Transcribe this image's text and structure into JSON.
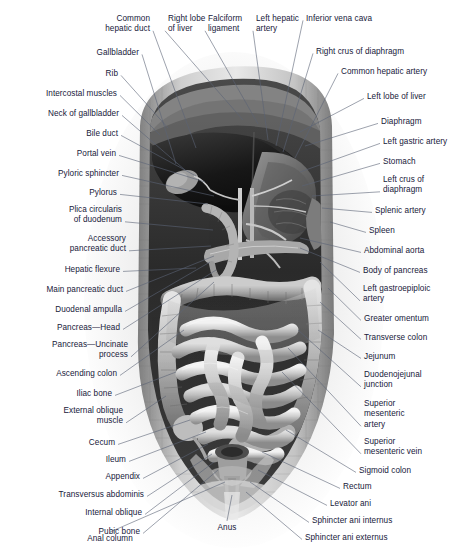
{
  "figure": {
    "background_color": "#ffffff",
    "label_color": "#17203a",
    "leader_color": "#5a6375"
  },
  "labels_left": [
    {
      "id": "common-hepatic-duct",
      "text": "Common\nhepatic duct",
      "x": 150,
      "y": 14,
      "anchor": [
        196,
        148
      ]
    },
    {
      "id": "gallbladder",
      "text": "Gallbladder",
      "x": 139,
      "y": 48,
      "anchor": [
        176,
        164
      ]
    },
    {
      "id": "rib",
      "text": "Rib",
      "x": 118,
      "y": 69,
      "anchor": [
        168,
        128
      ]
    },
    {
      "id": "intercostal-muscles",
      "text": "Intercostal muscles",
      "x": 117,
      "y": 89,
      "anchor": [
        160,
        135
      ]
    },
    {
      "id": "neck-of-gallbladder",
      "text": "Neck of gallbladder",
      "x": 119,
      "y": 109,
      "anchor": [
        185,
        170
      ]
    },
    {
      "id": "bile-duct",
      "text": "Bile duct",
      "x": 118,
      "y": 129,
      "anchor": [
        196,
        176
      ]
    },
    {
      "id": "portal-vein",
      "text": "Portal vein",
      "x": 116,
      "y": 149,
      "anchor": [
        205,
        182
      ]
    },
    {
      "id": "pyloric-sphincter",
      "text": "Pyloric sphincter",
      "x": 119,
      "y": 169,
      "anchor": [
        214,
        196
      ]
    },
    {
      "id": "pylorus",
      "text": "Pylorus",
      "x": 117,
      "y": 188,
      "anchor": [
        208,
        204
      ]
    },
    {
      "id": "plica-circularis",
      "text": "Plica circularis\nof duodenum",
      "x": 122,
      "y": 205,
      "anchor": [
        213,
        230
      ]
    },
    {
      "id": "accessory-pancreatic-duct",
      "text": "Accessory\npancreatic duct",
      "x": 126,
      "y": 234,
      "anchor": [
        211,
        246
      ]
    },
    {
      "id": "hepatic-flexure",
      "text": "Hepatic flexure",
      "x": 120,
      "y": 265,
      "anchor": [
        196,
        268
      ]
    },
    {
      "id": "main-pancreatic-duct",
      "text": "Main pancreatic duct",
      "x": 123,
      "y": 285,
      "anchor": [
        214,
        256
      ]
    },
    {
      "id": "duodenal-ampulla",
      "text": "Duodenal ampulla",
      "x": 122,
      "y": 305,
      "anchor": [
        210,
        262
      ]
    },
    {
      "id": "pancreas-head",
      "text": "Pancreas—Head",
      "x": 120,
      "y": 323,
      "anchor": [
        216,
        270
      ]
    },
    {
      "id": "pancreas-uncinate",
      "text": "Pancreas—Uncinate\nprocess",
      "x": 128,
      "y": 340,
      "anchor": [
        214,
        282
      ]
    },
    {
      "id": "ascending-colon",
      "text": "Ascending colon",
      "x": 117,
      "y": 369,
      "anchor": [
        184,
        330
      ]
    },
    {
      "id": "iliac-bone",
      "text": "Iliac bone",
      "x": 112,
      "y": 389,
      "anchor": [
        176,
        372
      ]
    },
    {
      "id": "external-oblique-muscle",
      "text": "External oblique\nmuscle",
      "x": 123,
      "y": 406,
      "anchor": [
        166,
        396
      ]
    },
    {
      "id": "cecum",
      "text": "Cecum",
      "x": 115,
      "y": 438,
      "anchor": [
        190,
        420
      ]
    },
    {
      "id": "ileum",
      "text": "Ileum",
      "x": 126,
      "y": 455,
      "anchor": [
        206,
        432
      ]
    },
    {
      "id": "appendix",
      "text": "Appendix",
      "x": 140,
      "y": 472,
      "anchor": [
        208,
        444
      ]
    },
    {
      "id": "transversus-abdominis",
      "text": "Transversus abdominis",
      "x": 144,
      "y": 490,
      "anchor": [
        212,
        454
      ]
    },
    {
      "id": "internal-oblique",
      "text": "Internal oblique",
      "x": 142,
      "y": 508,
      "anchor": [
        214,
        462
      ]
    },
    {
      "id": "pubic-bone",
      "text": "Pubic bone",
      "x": 140,
      "y": 527,
      "anchor": [
        218,
        470
      ]
    }
  ],
  "labels_right": [
    {
      "id": "right-lobe-of-liver",
      "text": "Right lobe\nof liver",
      "x": 168,
      "y": 14,
      "anchor": [
        243,
        120
      ]
    },
    {
      "id": "falciform-ligament",
      "text": "Falciform\nligament",
      "x": 208,
      "y": 14,
      "anchor": [
        258,
        124
      ]
    },
    {
      "id": "left-hepatic-artery",
      "text": "Left hepatic\nartery",
      "x": 256,
      "y": 14,
      "anchor": [
        268,
        140
      ]
    },
    {
      "id": "inferior-vena-cava",
      "text": "Inferior vena cava",
      "x": 306,
      "y": 14,
      "anchor": [
        276,
        146
      ]
    },
    {
      "id": "right-crus-of-diaphragm",
      "text": "Right crus of diaphragm",
      "x": 316,
      "y": 47,
      "anchor": [
        283,
        152
      ]
    },
    {
      "id": "common-hepatic-artery",
      "text": "Common hepatic artery",
      "x": 341,
      "y": 67,
      "anchor": [
        295,
        158
      ]
    },
    {
      "id": "left-lobe-of-liver",
      "text": "Left lobe of liver",
      "x": 367,
      "y": 92,
      "anchor": [
        300,
        132
      ]
    },
    {
      "id": "diaphragm",
      "text": "Diaphragm",
      "x": 381,
      "y": 117,
      "anchor": [
        305,
        146
      ]
    },
    {
      "id": "left-gastric-artery",
      "text": "Left gastric artery",
      "x": 383,
      "y": 137,
      "anchor": [
        300,
        172
      ]
    },
    {
      "id": "stomach",
      "text": "Stomach",
      "x": 383,
      "y": 157,
      "anchor": [
        302,
        186
      ]
    },
    {
      "id": "left-crus-of-diaphragm",
      "text": "Left crus of\ndiaphragm",
      "x": 383,
      "y": 175,
      "anchor": [
        312,
        196
      ]
    },
    {
      "id": "splenic-artery",
      "text": "Splenic artery",
      "x": 375,
      "y": 206,
      "anchor": [
        322,
        208
      ]
    },
    {
      "id": "spleen",
      "text": "Spleen",
      "x": 369,
      "y": 226,
      "anchor": [
        330,
        222
      ]
    },
    {
      "id": "abdominal-aorta",
      "text": "Abdominal aorta",
      "x": 364,
      "y": 246,
      "anchor": [
        300,
        238
      ]
    },
    {
      "id": "body-of-pancreas",
      "text": "Body of pancreas",
      "x": 363,
      "y": 266,
      "anchor": [
        300,
        248
      ]
    },
    {
      "id": "left-gastroepiploic-artery",
      "text": "Left gastroepiploic\nartery",
      "x": 363,
      "y": 284,
      "anchor": [
        320,
        262
      ]
    },
    {
      "id": "greater-omentum",
      "text": "Greater omentum",
      "x": 364,
      "y": 314,
      "anchor": [
        328,
        288
      ]
    },
    {
      "id": "transverse-colon",
      "text": "Transverse colon",
      "x": 364,
      "y": 333,
      "anchor": [
        320,
        302
      ]
    },
    {
      "id": "jejunum",
      "text": "Jejunum",
      "x": 364,
      "y": 352,
      "anchor": [
        318,
        330
      ]
    },
    {
      "id": "duodenojejunal-junction",
      "text": "Duodenojejunal\njunction",
      "x": 364,
      "y": 370,
      "anchor": [
        298,
        330
      ]
    },
    {
      "id": "superior-mesenteric-artery",
      "text": "Superior\nmesenteric\nartery",
      "x": 364,
      "y": 399,
      "anchor": [
        288,
        348
      ]
    },
    {
      "id": "superior-mesenteric-vein",
      "text": "Superior\nmesenteric vein",
      "x": 364,
      "y": 437,
      "anchor": [
        282,
        372
      ]
    },
    {
      "id": "sigmoid-colon",
      "text": "Sigmoid colon",
      "x": 359,
      "y": 466,
      "anchor": [
        286,
        430
      ]
    },
    {
      "id": "rectum",
      "text": "Rectum",
      "x": 343,
      "y": 482,
      "anchor": [
        262,
        452
      ]
    },
    {
      "id": "levator-ani",
      "text": "Levator ani",
      "x": 330,
      "y": 499,
      "anchor": [
        258,
        470
      ]
    },
    {
      "id": "sphincter-ani-internus",
      "text": "Sphincter ani internus",
      "x": 312,
      "y": 516,
      "anchor": [
        250,
        482
      ]
    },
    {
      "id": "sphincter-ani-externus",
      "text": "Sphincter ani externus",
      "x": 305,
      "y": 533,
      "anchor": [
        246,
        492
      ]
    }
  ],
  "labels_bottom": [
    {
      "id": "anal-column",
      "text": "Anal column",
      "x": 110,
      "y": 534,
      "anchor": [
        225,
        482
      ]
    },
    {
      "id": "anus",
      "text": "Anus",
      "x": 227,
      "y": 523,
      "anchor": [
        232,
        495
      ]
    }
  ]
}
